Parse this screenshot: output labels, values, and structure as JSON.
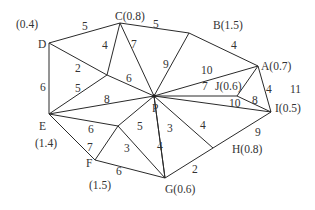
{
  "diagram": {
    "type": "weighted-graph",
    "colors": {
      "edge": "#2a2a2a",
      "text": "#333333",
      "background": "#ffffff"
    },
    "nodes": [
      {
        "id": "P",
        "label": "P",
        "x": 154,
        "y": 96,
        "lx": 152,
        "ly": 112
      },
      {
        "id": "A",
        "label": "A(0.7)",
        "x": 258,
        "y": 66,
        "lx": 261,
        "ly": 70
      },
      {
        "id": "B",
        "label": "B(1.5)",
        "x": 189,
        "y": 33,
        "lx": 213,
        "ly": 29
      },
      {
        "id": "C",
        "label": "C(0.8)",
        "x": 120,
        "y": 23,
        "lx": 115,
        "ly": 20
      },
      {
        "id": "D",
        "label": "D",
        "x": 49,
        "y": 43,
        "lx": 38,
        "ly": 48
      },
      {
        "id": "D_w",
        "label": "(0.4)",
        "lx": 16,
        "ly": 28
      },
      {
        "id": "E",
        "label": "E",
        "x": 49,
        "y": 114,
        "lx": 39,
        "ly": 130
      },
      {
        "id": "E_w",
        "label": "(1.4)",
        "lx": 35,
        "ly": 147
      },
      {
        "id": "F",
        "label": "F",
        "x": 95,
        "y": 160,
        "lx": 86,
        "ly": 167
      },
      {
        "id": "F_w",
        "label": "(1.5)",
        "lx": 89,
        "ly": 189
      },
      {
        "id": "G",
        "label": "G(0.6)",
        "x": 165,
        "y": 178,
        "lx": 165,
        "ly": 193
      },
      {
        "id": "H",
        "label": "H(0.8)",
        "x": 213,
        "y": 148,
        "lx": 232,
        "ly": 153
      },
      {
        "id": "I",
        "label": "I(0.5)",
        "x": 271,
        "y": 112,
        "lx": 275,
        "ly": 112
      },
      {
        "id": "J",
        "label": "J(0.6)",
        "x": 237,
        "y": 96,
        "lx": 215,
        "ly": 90
      },
      {
        "id": "N1",
        "label": "",
        "x": 107,
        "y": 75
      },
      {
        "id": "N2",
        "label": "",
        "x": 118,
        "y": 126
      }
    ],
    "edges": [
      {
        "from": "D",
        "to": "C",
        "weight": "5",
        "wx": 82,
        "wy": 30
      },
      {
        "from": "C",
        "to": "B",
        "weight": "5",
        "wx": 153,
        "wy": 28
      },
      {
        "from": "B",
        "to": "A",
        "weight": "4",
        "wx": 231,
        "wy": 49
      },
      {
        "from": "A",
        "to": "I",
        "weight": "4",
        "wx": 266,
        "wy": 93
      },
      {
        "from": "I",
        "to": "H",
        "weight": "9",
        "wx": 255,
        "wy": 136
      },
      {
        "from": "H",
        "to": "G",
        "weight": "2",
        "wx": 192,
        "wy": 173
      },
      {
        "from": "G",
        "to": "F",
        "weight": "6",
        "wx": 116,
        "wy": 175
      },
      {
        "from": "F",
        "to": "E",
        "weight": "7",
        "wx": 87,
        "wy": 151
      },
      {
        "from": "E",
        "to": "D",
        "weight": "6",
        "wx": 40,
        "wy": 91
      },
      {
        "from": "C",
        "to": "N1",
        "weight": "4",
        "wx": 102,
        "wy": 49
      },
      {
        "from": "D",
        "to": "N1",
        "weight": "2",
        "wx": 75,
        "wy": 72
      },
      {
        "from": "N1",
        "to": "E",
        "weight": "5",
        "wx": 75,
        "wy": 92
      },
      {
        "from": "N1",
        "to": "P",
        "weight": "6",
        "wx": 126,
        "wy": 82
      },
      {
        "from": "C",
        "to": "P",
        "weight": "7",
        "wx": 131,
        "wy": 48
      },
      {
        "from": "B",
        "to": "P",
        "weight": "9",
        "wx": 163,
        "wy": 68
      },
      {
        "from": "A",
        "to": "P",
        "weight": "10",
        "wx": 201,
        "wy": 74
      },
      {
        "from": "J",
        "to": "P",
        "weight": "7",
        "wx": 202,
        "wy": 90
      },
      {
        "from": "I",
        "to": "P",
        "weight": "10",
        "wx": 229,
        "wy": 107
      },
      {
        "from": "J",
        "to": "A",
        "weight": "",
        "wx": 0,
        "wy": 0
      },
      {
        "from": "J",
        "to": "I",
        "weight": "8",
        "wx": 252,
        "wy": 104
      },
      {
        "from": "H",
        "to": "P",
        "weight": "4",
        "wx": 200,
        "wy": 129
      },
      {
        "from": "G",
        "to": "P",
        "weight": "3",
        "wx": 167,
        "wy": 132
      },
      {
        "from": "E",
        "to": "P",
        "weight": "8",
        "wx": 104,
        "wy": 103
      },
      {
        "from": "E",
        "to": "N2",
        "weight": "6",
        "wx": 88,
        "wy": 133
      },
      {
        "from": "N2",
        "to": "P",
        "weight": "5",
        "wx": 137,
        "wy": 130
      },
      {
        "from": "N2",
        "to": "F",
        "weight": "",
        "wx": 0,
        "wy": 0
      },
      {
        "from": "N2",
        "to": "G",
        "weight": "3",
        "wx": 124,
        "wy": 152
      },
      {
        "from": "G",
        "to": "P",
        "weight": "4",
        "wx": 157,
        "wy": 150
      }
    ],
    "extra_labels": [
      {
        "text": "11",
        "x": 290,
        "y": 93
      }
    ]
  }
}
